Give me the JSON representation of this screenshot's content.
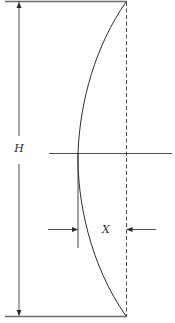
{
  "diagram": {
    "type": "deflection-diagram",
    "labels": {
      "height": "H",
      "deflection": "X"
    },
    "colors": {
      "line": "#3a3a3a",
      "background": "#ffffff"
    },
    "geometry": {
      "top_y": 1,
      "bottom_y": 316,
      "dashed_x": 126,
      "curve_min_x": 78,
      "midline_y": 153,
      "dimension_x": 19
    }
  }
}
